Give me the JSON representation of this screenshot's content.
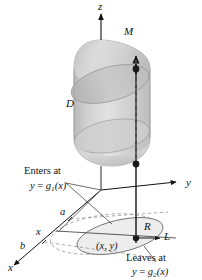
{
  "figure": {
    "domain_type": "3d-solid-over-plane-region",
    "background_color": "#ffffff",
    "ink_color": "#121212",
    "solid_fill_light": "#dedede",
    "solid_fill_mid": "#c9c9c9",
    "solid_fill_dark": "#b4b4b4",
    "region_fill": "#ececec"
  },
  "axes": {
    "z_label": "z",
    "y_label": "y",
    "x_label": "x"
  },
  "solid": {
    "label": "D"
  },
  "points": {
    "top_point_label": "M",
    "region_label": "R",
    "base_point_label": "(x, y)",
    "line_label": "L"
  },
  "interval": {
    "a_label": "a",
    "b_label": "b",
    "x_tick_label": "x"
  },
  "annotations": {
    "enters": {
      "caption": "Enters at",
      "equation_lhs": "y",
      "equation_eq": "=",
      "equation_fn": "g",
      "equation_sub": "1",
      "equation_arg": "(x)"
    },
    "leaves": {
      "caption": "Leaves at",
      "equation_lhs": "y",
      "equation_eq": "=",
      "equation_fn": "g",
      "equation_sub": "2",
      "equation_arg": "(x)"
    }
  }
}
